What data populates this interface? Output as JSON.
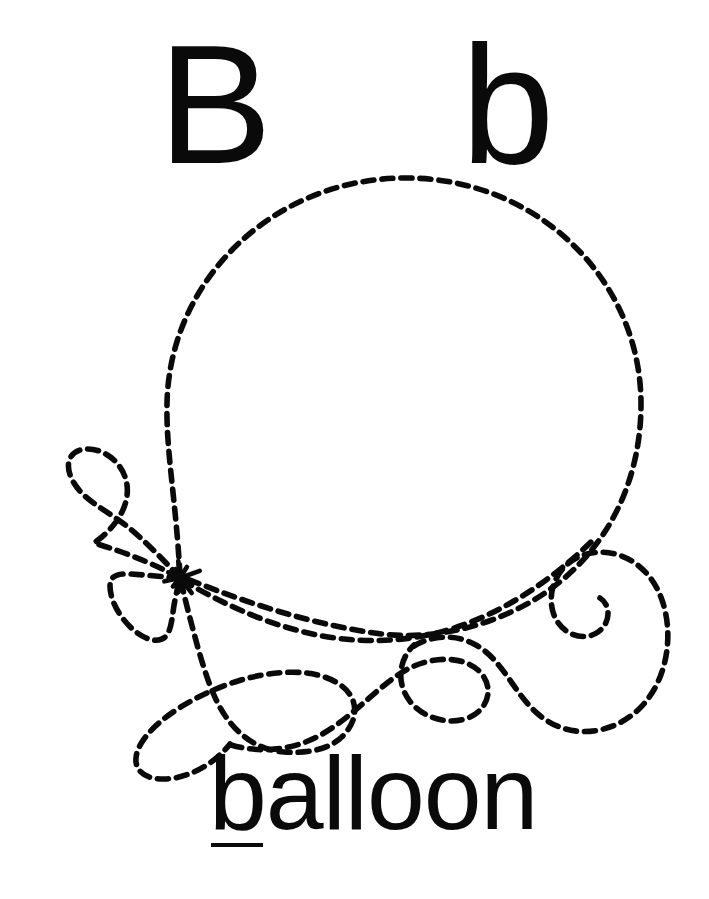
{
  "worksheet": {
    "kind": "alphabet-tracing-worksheet",
    "letter": "B",
    "uppercase": "B",
    "lowercase": "b",
    "word": "balloon",
    "subject": "balloon",
    "background_color": "#ffffff",
    "ink_color": "#0a0a0a",
    "underlined_letter": "b"
  },
  "trace": {
    "style": "dashed",
    "dash_length": 11,
    "dash_gap": 8,
    "stroke_width": 5.5,
    "stroke_color": "#0a0a0a",
    "start_marker": "star-burst",
    "start_marker_x": 180,
    "start_marker_y": 578,
    "balloon": {
      "center_x": 404,
      "center_y": 404,
      "radius_x": 237,
      "radius_y": 228,
      "top_y": 178,
      "bottom_y": 634,
      "left_x": 165,
      "right_x": 641
    },
    "string_parts": [
      "upper-left-teardrop-loop",
      "knot-leaf",
      "bottom-left-large-loop",
      "center-wave",
      "center-curl",
      "right-spiral-curl"
    ]
  },
  "labels": {
    "uppercase_label": "B",
    "lowercase_label": "b",
    "word_label": "balloon"
  }
}
